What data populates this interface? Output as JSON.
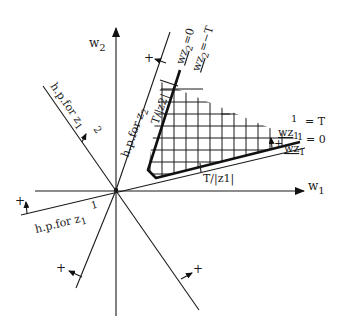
{
  "figure": {
    "axes": {
      "x_label": "w",
      "x_sub": "1",
      "y_label": "w",
      "y_sub": "2"
    },
    "hyperplanes": [
      {
        "id": "hp-z2-upper",
        "label": "h.p.for z",
        "sub": "2",
        "sup": "",
        "sign": "+"
      },
      {
        "id": "hp-z21",
        "label": "h.p.for z",
        "sub": "1",
        "sup": "2",
        "sign": "+"
      },
      {
        "id": "hp-z11",
        "label": "h.p.for z",
        "sub": "1",
        "sup": "1",
        "sign": "+"
      },
      {
        "id": "hp-lower-left",
        "label": "",
        "sign": "+"
      },
      {
        "id": "hp-lower-right",
        "label": "",
        "sign": "+"
      }
    ],
    "constraints": {
      "wz2_eq_0": {
        "lhs": "wz",
        "sub": "2",
        "rhs": "=0"
      },
      "wz2_eq_T": {
        "lhs": "wz",
        "sub": "2",
        "rhs": "=−T"
      },
      "wz1_eq_T": {
        "lhs": "wz",
        "sup": "1",
        "sub": "1",
        "rhs": "= T"
      },
      "wz1_eq_0": {
        "lhs": "wz",
        "sup": "1",
        "sub": "1",
        "rhs": "= 0"
      }
    },
    "distances": {
      "z2": "T/|z2|",
      "z1": "T/|z1|"
    },
    "plus_sign": "+",
    "region": "solution region (hatched)"
  }
}
